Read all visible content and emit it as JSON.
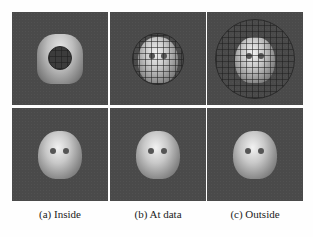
{
  "figure": {
    "panels": [
      {
        "row": 1,
        "column": "a",
        "content": "head model with small wireframe sphere inside"
      },
      {
        "row": 1,
        "column": "b",
        "content": "head model with wireframe sphere at data"
      },
      {
        "row": 1,
        "column": "c",
        "content": "head model with large wireframe sphere outside"
      },
      {
        "row": 2,
        "column": "a",
        "content": "reconstructed head surface"
      },
      {
        "row": 2,
        "column": "b",
        "content": "reconstructed head surface"
      },
      {
        "row": 2,
        "column": "c",
        "content": "reconstructed head surface"
      }
    ],
    "captions": [
      "(a)  Inside",
      "(b)  At data",
      "(c)  Outside"
    ],
    "colors": {
      "panel_bg": "#4a4a4a",
      "page_bg": "#fefefe",
      "wireframe": "#2a2a2a"
    }
  }
}
